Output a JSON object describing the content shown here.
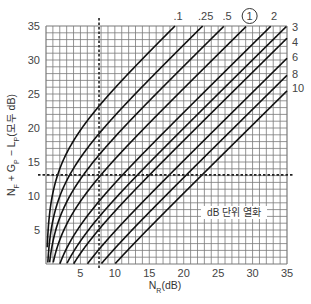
{
  "chart_data": {
    "type": "line",
    "title": "",
    "xlabel": "N_R(dB)",
    "ylabel": "N_F + G_P − L_P(모두 dB)",
    "xlim": [
      0,
      35
    ],
    "ylim": [
      0,
      35
    ],
    "xticks": [
      5,
      10,
      15,
      20,
      25,
      30,
      35
    ],
    "yticks": [
      5,
      10,
      15,
      20,
      25,
      30,
      35
    ],
    "grid": true,
    "grid_step": 1,
    "annotation": "dB 단위 열화",
    "circled_label": "1",
    "formula": "y = N_R - 10*log10(10^(D/10) - 1)",
    "series": [
      {
        "name": ".1",
        "degradation_db": 0.1,
        "label_pos": "top",
        "offset_db": 16.36
      },
      {
        "name": ".25",
        "degradation_db": 0.25,
        "label_pos": "top",
        "offset_db": 12.27
      },
      {
        "name": ".5",
        "degradation_db": 0.5,
        "label_pos": "top",
        "offset_db": 9.14
      },
      {
        "name": "1",
        "degradation_db": 1,
        "label_pos": "top",
        "offset_db": 5.87
      },
      {
        "name": "2",
        "degradation_db": 2,
        "label_pos": "top",
        "offset_db": 2.33
      },
      {
        "name": "3",
        "degradation_db": 3,
        "label_pos": "right",
        "offset_db": 0.02
      },
      {
        "name": "4",
        "degradation_db": 4,
        "label_pos": "right",
        "offset_db": -1.8
      },
      {
        "name": "6",
        "degradation_db": 6,
        "label_pos": "right",
        "offset_db": -4.74
      },
      {
        "name": "8",
        "degradation_db": 8,
        "label_pos": "right",
        "offset_db": -7.25
      },
      {
        "name": "10",
        "degradation_db": 10,
        "label_pos": "right",
        "offset_db": -9.54
      }
    ],
    "reference_lines": {
      "vertical_x": 7.7,
      "horizontal_y": 13.1
    }
  },
  "colors": {
    "grid": "#7a7a7a",
    "curve": "#111111",
    "text": "#444444",
    "background": "#ffffff"
  }
}
